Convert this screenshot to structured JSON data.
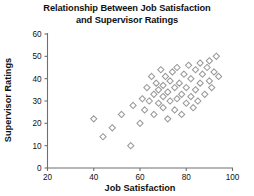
{
  "chart_data": {
    "type": "scatter",
    "title": "Relationship Between Job Satisfaction and Supervisor Ratings",
    "title_line1": "Relationship Between Job Satisfaction",
    "title_line2": "and Supervisor Ratings",
    "xlabel": "Job Satisfaction",
    "ylabel": "Supervisor Ratings",
    "xlim": [
      20,
      100
    ],
    "ylim": [
      0,
      60
    ],
    "xticks": [
      20,
      40,
      60,
      80,
      100
    ],
    "yticks": [
      0,
      10,
      20,
      30,
      40,
      50,
      60
    ],
    "grid": false,
    "legend": null,
    "marker": "open-diamond",
    "marker_color": "#9a9a9a",
    "marker_fill": "#ffffff",
    "axis_color": "#6f6f6f",
    "points": [
      {
        "x": 40,
        "y": 22
      },
      {
        "x": 44,
        "y": 14
      },
      {
        "x": 48,
        "y": 18
      },
      {
        "x": 52,
        "y": 24
      },
      {
        "x": 56,
        "y": 10
      },
      {
        "x": 57,
        "y": 28
      },
      {
        "x": 60,
        "y": 20
      },
      {
        "x": 61,
        "y": 31
      },
      {
        "x": 62,
        "y": 26
      },
      {
        "x": 63,
        "y": 36
      },
      {
        "x": 64,
        "y": 30
      },
      {
        "x": 65,
        "y": 41
      },
      {
        "x": 66,
        "y": 24
      },
      {
        "x": 66,
        "y": 33
      },
      {
        "x": 67,
        "y": 38
      },
      {
        "x": 68,
        "y": 29
      },
      {
        "x": 68,
        "y": 35
      },
      {
        "x": 69,
        "y": 44
      },
      {
        "x": 70,
        "y": 27
      },
      {
        "x": 70,
        "y": 32
      },
      {
        "x": 70,
        "y": 37
      },
      {
        "x": 71,
        "y": 41
      },
      {
        "x": 72,
        "y": 22
      },
      {
        "x": 72,
        "y": 34
      },
      {
        "x": 73,
        "y": 30
      },
      {
        "x": 73,
        "y": 39
      },
      {
        "x": 74,
        "y": 43
      },
      {
        "x": 75,
        "y": 26
      },
      {
        "x": 75,
        "y": 36
      },
      {
        "x": 76,
        "y": 31
      },
      {
        "x": 76,
        "y": 45
      },
      {
        "x": 77,
        "y": 38
      },
      {
        "x": 78,
        "y": 24
      },
      {
        "x": 78,
        "y": 33
      },
      {
        "x": 79,
        "y": 42
      },
      {
        "x": 80,
        "y": 29
      },
      {
        "x": 80,
        "y": 36
      },
      {
        "x": 81,
        "y": 46
      },
      {
        "x": 82,
        "y": 32
      },
      {
        "x": 82,
        "y": 40
      },
      {
        "x": 83,
        "y": 27
      },
      {
        "x": 84,
        "y": 44
      },
      {
        "x": 84,
        "y": 35
      },
      {
        "x": 85,
        "y": 30
      },
      {
        "x": 86,
        "y": 47
      },
      {
        "x": 86,
        "y": 38
      },
      {
        "x": 87,
        "y": 42
      },
      {
        "x": 88,
        "y": 33
      },
      {
        "x": 89,
        "y": 45
      },
      {
        "x": 90,
        "y": 39
      },
      {
        "x": 90,
        "y": 48
      },
      {
        "x": 91,
        "y": 36
      },
      {
        "x": 92,
        "y": 43
      },
      {
        "x": 93,
        "y": 50
      },
      {
        "x": 94,
        "y": 41
      }
    ]
  }
}
